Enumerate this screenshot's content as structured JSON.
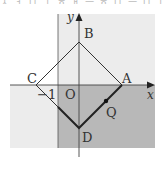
{
  "header": {
    "partial_text": "ㅅ ㅓ ㅁ ㅣ ㅎ ㅐ ㅡ ㅎ ㅁ ㅡ ㅁ ㅣ ㅇ ㅣ"
  },
  "figure": {
    "axes": {
      "x_label": "x",
      "y_label": "y",
      "origin_label": "O",
      "tick_label_neg1": "−1"
    },
    "points": {
      "A": {
        "label": "A",
        "coords": [
          1,
          0
        ]
      },
      "B": {
        "label": "B",
        "coords": [
          0,
          1
        ]
      },
      "C": {
        "label": "C",
        "coords": [
          -1,
          0
        ]
      },
      "D": {
        "label": "D",
        "coords": [
          0,
          -1
        ]
      },
      "Q": {
        "label": "Q",
        "on_segment": "AD"
      }
    },
    "regions": {
      "light_region_color": "#ececec",
      "dark_region_color": "#b8b8b8",
      "description": "Shaded region x >= -1, y <= 0 (dark); light gray region elsewhere"
    },
    "line_color": "#333333"
  }
}
